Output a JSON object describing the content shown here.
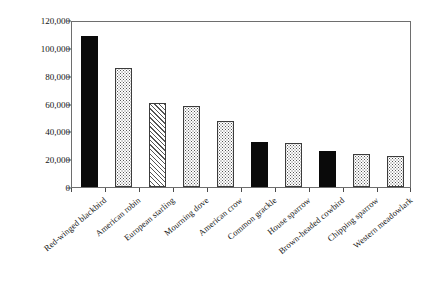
{
  "chart_data": {
    "type": "bar",
    "title": "",
    "xlabel": "",
    "ylabel": "Relative abundance",
    "ylim": [
      0,
      120000
    ],
    "ytick_values": [
      0,
      20000,
      40000,
      60000,
      80000,
      100000,
      120000
    ],
    "ytick_labels": [
      "0",
      "20,000",
      "40,000",
      "60,000",
      "80,000",
      "100,000",
      "120,000"
    ],
    "grid": false,
    "legend": "none",
    "categories": [
      "Red-winged blackbird",
      "American robin",
      "European starling",
      "Mourning dove",
      "American crow",
      "Common grackle",
      "House sparrow",
      "Brown-headed cowbird",
      "Chipping sparrow",
      "Western meadowlark"
    ],
    "values": [
      108500,
      85500,
      60500,
      58500,
      47500,
      32000,
      31500,
      26000,
      23500,
      22000
    ],
    "bar_styles": [
      "solid",
      "dotted",
      "hatch",
      "dotted",
      "dotted",
      "solid",
      "dotted",
      "solid",
      "dotted",
      "dotted"
    ],
    "colors": {
      "solid_fill": "#0a0a0a",
      "pattern_stroke": "#555555",
      "bar_outline": "#3c3c3c",
      "axis": "#6e6e6e",
      "text": "#141414",
      "background": "#ffffff"
    }
  }
}
